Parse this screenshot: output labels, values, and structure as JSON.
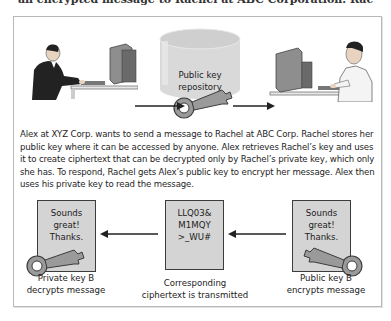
{
  "header": {
    "cropped_title_line": "an encrypted message to Rachel at ABC Corporation. Rac"
  },
  "top_scene": {
    "sender": {
      "name": "Alex",
      "role": "person-at-computer-left"
    },
    "repository": {
      "label_line1": "Public key",
      "label_line2": "repository"
    },
    "receiver": {
      "name": "Rachel",
      "role": "person-at-computer-right"
    }
  },
  "caption": {
    "text": "Alex at XYZ Corp. wants to send a message to Rachel at ABC Corp. Rachel stores her public key where it can be accessed by anyone. Alex retrieves Rachel’s key and uses it to create ciphertext that can be decrypted only by Rachel’s private key, which only she has. To respond, Rachel gets Alex’s public key to encrypt her message. Alex then uses his private key to read the message."
  },
  "bottom_flow": {
    "left": {
      "doc_lines": [
        "Sounds",
        "great!",
        "Thanks."
      ],
      "label_line1": "Private key B",
      "label_line2": "decrypts message"
    },
    "middle": {
      "doc_lines": [
        "LLQ03&",
        "M1MQY",
        ">_WU#"
      ],
      "label_line1": "Corresponding",
      "label_line2": "ciphertext is transmitted"
    },
    "right": {
      "doc_lines": [
        "Sounds",
        "great!",
        "Thanks."
      ],
      "label_line1": "Public key B",
      "label_line2": "encrypts message"
    }
  },
  "colors": {
    "key": "#9a9a9a",
    "key_dark": "#4a4a4a",
    "doc_fill": "#d4d4d4",
    "repository_fill": "#d9d9d9",
    "frame_border": "#b8b8b8"
  }
}
